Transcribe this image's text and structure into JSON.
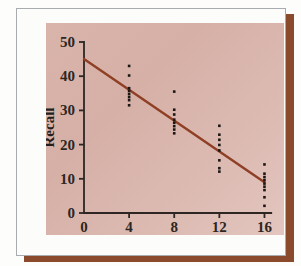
{
  "figure": {
    "background_color": "#fdfdfc",
    "card_color": "#fcfcfb",
    "card_border_color": "#a9acae",
    "shadow_color": "#8a4a2b",
    "panel_gradient_from": "#d9b4ab",
    "panel_gradient_to": "#e3c6bf"
  },
  "chart_data": {
    "type": "scatter",
    "title": "",
    "subtitle": "",
    "xlabel": "Dosage",
    "ylabel": "Recall",
    "xlim": [
      0,
      17.2
    ],
    "ylim": [
      0,
      50
    ],
    "xticks": [
      0,
      4,
      8,
      12,
      16
    ],
    "xtick_labels": [
      "0",
      "4",
      "8",
      "12",
      "16"
    ],
    "yticks": [
      0,
      10,
      20,
      30,
      40,
      50
    ],
    "ytick_labels": [
      "0",
      "10",
      "20",
      "30",
      "40",
      "50"
    ],
    "grid": false,
    "legend": null,
    "legend_position": "none",
    "marker": "square-dot",
    "marker_color": "#1b1714",
    "marker_size_px": 2.6,
    "series": [
      {
        "name": "Observations",
        "type": "scatter",
        "x": [
          4,
          4,
          4,
          4,
          4,
          4,
          4,
          4,
          8,
          8,
          8,
          8,
          8,
          8,
          8,
          8,
          12,
          12,
          12,
          12,
          12,
          12,
          12,
          12,
          16,
          16,
          16,
          16,
          16,
          16,
          16,
          16,
          16
        ],
        "y": [
          43,
          40.2,
          36.5,
          35.7,
          34.8,
          33.9,
          33,
          31.5,
          35.5,
          30.2,
          28.8,
          27.3,
          26.4,
          25.4,
          24.4,
          23.3,
          25.5,
          22.9,
          21.4,
          19.9,
          18.3,
          15.4,
          13.1,
          12.1,
          14.2,
          11.5,
          10.5,
          9.6,
          8.6,
          7.7,
          6.7,
          4.6,
          2.1
        ]
      },
      {
        "name": "Regression line",
        "type": "line",
        "color": "#8e3f24",
        "line_width_px": 2.4,
        "x": [
          0,
          16
        ],
        "y": [
          45,
          9
        ]
      }
    ],
    "regression": {
      "intercept": 45,
      "slope": -2.25,
      "equation": "Recall = 45 - 2.25 x Dosage",
      "x_start": 0,
      "x_end": 16,
      "y_start": 45,
      "y_end": 9
    },
    "groups": [
      {
        "dosage": 4,
        "values": [
          43,
          40.2,
          36.5,
          35.7,
          34.8,
          33.9,
          33,
          31.5
        ]
      },
      {
        "dosage": 8,
        "values": [
          35.5,
          30.2,
          28.8,
          27.3,
          26.4,
          25.4,
          24.4,
          23.3
        ]
      },
      {
        "dosage": 12,
        "values": [
          25.5,
          22.9,
          21.4,
          19.9,
          18.3,
          15.4,
          13.1,
          12.1
        ]
      },
      {
        "dosage": 16,
        "values": [
          14.2,
          11.5,
          10.5,
          9.6,
          8.6,
          7.7,
          6.7,
          4.6,
          2.1
        ]
      }
    ],
    "axis_color": "#2d2622",
    "axis_width_px": 1.8
  }
}
